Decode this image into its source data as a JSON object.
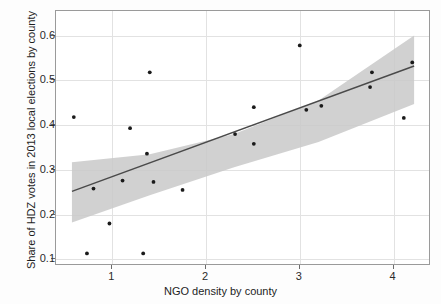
{
  "chart_data": {
    "type": "scatter",
    "title": "",
    "xlabel": "NGO density by county",
    "ylabel": "Share of HDZ votes in 2013 local elections by county",
    "xlim": [
      0.4,
      4.4
    ],
    "ylim": [
      0.085,
      0.655
    ],
    "xticks": [
      1,
      2,
      3,
      4
    ],
    "xtick_labels": [
      "1",
      "2",
      "3",
      "4"
    ],
    "yticks": [
      0.1,
      0.2,
      0.3,
      0.4,
      0.5,
      0.6
    ],
    "ytick_labels": [
      "0.1",
      "0.2",
      "0.3",
      "0.4",
      "0.5",
      "0.6"
    ],
    "grid": true,
    "point_color": "#1a1a1a",
    "line_color": "#4a4a4a",
    "band_color": "#c9c9c9",
    "points": [
      {
        "x": 0.59,
        "y": 0.418
      },
      {
        "x": 0.73,
        "y": 0.113
      },
      {
        "x": 0.8,
        "y": 0.258
      },
      {
        "x": 0.97,
        "y": 0.18
      },
      {
        "x": 1.11,
        "y": 0.276
      },
      {
        "x": 1.19,
        "y": 0.393
      },
      {
        "x": 1.33,
        "y": 0.113
      },
      {
        "x": 1.37,
        "y": 0.336
      },
      {
        "x": 1.44,
        "y": 0.273
      },
      {
        "x": 1.4,
        "y": 0.518
      },
      {
        "x": 1.75,
        "y": 0.255
      },
      {
        "x": 2.31,
        "y": 0.38
      },
      {
        "x": 2.51,
        "y": 0.44
      },
      {
        "x": 2.51,
        "y": 0.358
      },
      {
        "x": 3.0,
        "y": 0.578
      },
      {
        "x": 3.07,
        "y": 0.434
      },
      {
        "x": 3.23,
        "y": 0.443
      },
      {
        "x": 3.77,
        "y": 0.518
      },
      {
        "x": 3.75,
        "y": 0.485
      },
      {
        "x": 4.11,
        "y": 0.416
      },
      {
        "x": 4.2,
        "y": 0.54
      }
    ],
    "fit_line": {
      "name": "linear fit",
      "x_start": 0.57,
      "y_start": 0.252,
      "x_end": 4.22,
      "y_end": 0.532
    },
    "confidence_band": {
      "name": "95% confidence interval",
      "x": [
        0.57,
        1.4,
        2.3,
        3.2,
        4.22
      ],
      "upper": [
        0.317,
        0.335,
        0.38,
        0.455,
        0.6
      ],
      "lower": [
        0.182,
        0.243,
        0.306,
        0.362,
        0.447
      ]
    }
  }
}
